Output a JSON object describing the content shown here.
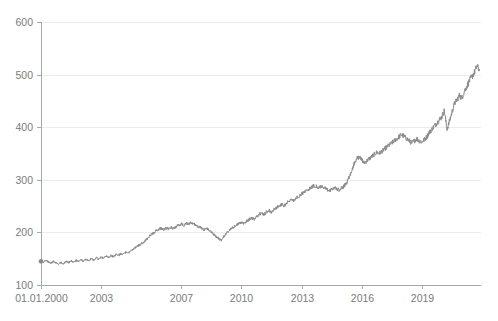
{
  "chart_data": {
    "type": "line",
    "title": "",
    "subtitle": "",
    "xlabel": "",
    "ylabel": "",
    "grid": true,
    "legend": "none",
    "line_color": "#8a8a8a",
    "grid_color": "#ececec",
    "axis_color": "#a8a8a8",
    "tick_label_color": "#7b7b7b",
    "background_color": "#ffffff",
    "ylim": [
      100,
      600
    ],
    "yticks": [
      100,
      200,
      300,
      400,
      500,
      600
    ],
    "ytick_labels": [
      "100",
      "200",
      "300",
      "400",
      "500",
      "600"
    ],
    "xlim": [
      "2000-01-01",
      "2021-12-31"
    ],
    "xticks": [
      2000,
      2003,
      2007,
      2010,
      2013,
      2016,
      2019
    ],
    "xtick_labels": [
      "01.01.2000",
      "2003",
      "2007",
      "2010",
      "2013",
      "2016",
      "2019"
    ],
    "start_marker": {
      "x": 2000.0,
      "y": 145
    },
    "series": [
      {
        "name": "index",
        "x": [
          2000.0,
          2000.12,
          2000.25,
          2000.37,
          2000.5,
          2000.62,
          2000.75,
          2000.87,
          2001.0,
          2001.12,
          2001.25,
          2001.37,
          2001.5,
          2001.62,
          2001.75,
          2001.87,
          2002.0,
          2002.12,
          2002.25,
          2002.37,
          2002.5,
          2002.62,
          2002.75,
          2002.87,
          2003.0,
          2003.12,
          2003.25,
          2003.37,
          2003.5,
          2003.62,
          2003.75,
          2003.87,
          2004.0,
          2004.12,
          2004.25,
          2004.37,
          2004.5,
          2004.62,
          2004.75,
          2004.87,
          2005.0,
          2005.12,
          2005.25,
          2005.37,
          2005.5,
          2005.62,
          2005.75,
          2005.87,
          2006.0,
          2006.12,
          2006.25,
          2006.37,
          2006.5,
          2006.62,
          2006.75,
          2006.87,
          2007.0,
          2007.12,
          2007.25,
          2007.37,
          2007.5,
          2007.62,
          2007.75,
          2007.87,
          2008.0,
          2008.12,
          2008.25,
          2008.37,
          2008.5,
          2008.62,
          2008.75,
          2008.87,
          2009.0,
          2009.12,
          2009.25,
          2009.37,
          2009.5,
          2009.62,
          2009.75,
          2009.87,
          2010.0,
          2010.12,
          2010.25,
          2010.37,
          2010.5,
          2010.62,
          2010.75,
          2010.87,
          2011.0,
          2011.12,
          2011.25,
          2011.37,
          2011.5,
          2011.62,
          2011.75,
          2011.87,
          2012.0,
          2012.12,
          2012.25,
          2012.37,
          2012.5,
          2012.62,
          2012.75,
          2012.87,
          2013.0,
          2013.12,
          2013.25,
          2013.37,
          2013.5,
          2013.62,
          2013.75,
          2013.87,
          2014.0,
          2014.12,
          2014.25,
          2014.37,
          2014.5,
          2014.62,
          2014.75,
          2014.87,
          2015.0,
          2015.12,
          2015.25,
          2015.37,
          2015.5,
          2015.62,
          2015.75,
          2015.87,
          2016.0,
          2016.12,
          2016.25,
          2016.37,
          2016.5,
          2016.62,
          2016.75,
          2016.87,
          2017.0,
          2017.12,
          2017.25,
          2017.37,
          2017.5,
          2017.62,
          2017.75,
          2017.87,
          2018.0,
          2018.12,
          2018.25,
          2018.37,
          2018.5,
          2018.62,
          2018.75,
          2018.87,
          2019.0,
          2019.12,
          2019.25,
          2019.37,
          2019.5,
          2019.62,
          2019.75,
          2019.87,
          2020.0,
          2020.12,
          2020.25,
          2020.37,
          2020.5,
          2020.62,
          2020.75,
          2020.87,
          2021.0,
          2021.12,
          2021.25,
          2021.37,
          2021.5,
          2021.62,
          2021.75,
          2021.87
        ],
        "y": [
          145,
          143,
          147,
          144,
          141,
          145,
          142,
          139,
          143,
          140,
          145,
          142,
          146,
          143,
          147,
          144,
          148,
          145,
          149,
          146,
          150,
          147,
          152,
          149,
          153,
          151,
          155,
          152,
          156,
          154,
          158,
          156,
          160,
          158,
          163,
          161,
          166,
          169,
          172,
          175,
          178,
          181,
          186,
          191,
          196,
          199,
          203,
          206,
          208,
          205,
          209,
          206,
          210,
          207,
          211,
          214,
          216,
          213,
          218,
          215,
          219,
          216,
          213,
          210,
          209,
          205,
          208,
          204,
          200,
          196,
          192,
          188,
          185,
          192,
          198,
          203,
          207,
          210,
          214,
          217,
          219,
          216,
          221,
          224,
          228,
          225,
          230,
          234,
          237,
          234,
          239,
          242,
          238,
          243,
          247,
          250,
          253,
          250,
          256,
          259,
          263,
          260,
          266,
          269,
          273,
          276,
          280,
          283,
          286,
          289,
          287,
          284,
          288,
          285,
          282,
          278,
          282,
          285,
          283,
          280,
          284,
          288,
          295,
          305,
          318,
          330,
          340,
          344,
          338,
          332,
          336,
          340,
          344,
          348,
          352,
          350,
          354,
          358,
          362,
          366,
          370,
          374,
          378,
          382,
          386,
          382,
          378,
          374,
          370,
          374,
          378,
          374,
          372,
          376,
          382,
          390,
          396,
          402,
          408,
          414,
          420,
          432,
          396,
          410,
          428,
          444,
          452,
          460,
          456,
          468,
          478,
          488,
          496,
          504,
          516,
          508
        ]
      }
    ]
  }
}
